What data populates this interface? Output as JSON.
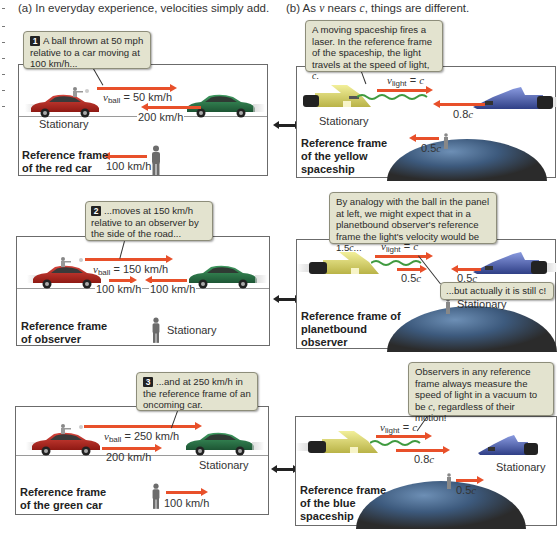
{
  "headings": {
    "a": "(a)  In everyday experience, velocities simply add.",
    "b_prefix": "(b)  As ",
    "b_v": "v",
    "b_mid": " nears ",
    "b_c": "c",
    "b_suffix": ", things are different."
  },
  "colors": {
    "arrow": "#e8502a",
    "callout_bg": "#e3e3cf",
    "red_car": "#b3231d",
    "green_car": "#2e7a4b",
    "yellow_ship": "#e2df7a",
    "blue_ship": "#4a5da8"
  },
  "left_panels": [
    {
      "callout_num": "1",
      "callout_text": "A ball thrown at 50 mph relative to a car moving at 100 km/h...",
      "v_symbol": "v",
      "v_sub": "ball",
      "v_value": " = 50 km/h",
      "green_speed": "200 km/h",
      "red_status": "Stationary",
      "observer_speed": "100 km/h",
      "frame_label_1": "Reference frame",
      "frame_label_2": "of the red car"
    },
    {
      "callout_num": "2",
      "callout_text": "...moves at 150 km/h relative to an observer by the side of the road...",
      "v_symbol": "v",
      "v_sub": "ball",
      "v_value": " = 150 km/h",
      "red_speed": "100 km/h",
      "green_speed": "100 km/h",
      "observer_status": "Stationary",
      "frame_label_1": "Reference frame",
      "frame_label_2": "of observer"
    },
    {
      "callout_num": "3",
      "callout_text": "...and at 250 km/h in the reference frame of an oncoming car.",
      "v_symbol": "v",
      "v_sub": "ball",
      "v_value": " = 250 km/h",
      "red_speed": "200 km/h",
      "green_status": "Stationary",
      "observer_speed": "100 km/h",
      "frame_label_1": "Reference frame",
      "frame_label_2": "of the green car"
    }
  ],
  "right_panels": [
    {
      "callout_text_1": "A moving spaceship fires a laser. In the reference frame of the spaceship, the light travels at the speed of light, ",
      "callout_c": "c",
      "callout_text_2": ".",
      "v_symbol": "v",
      "v_sub": "light",
      "v_eq": " = ",
      "v_c": "c",
      "blue_speed_num": "0.8",
      "blue_speed_c": "c",
      "yellow_status": "Stationary",
      "earth_speed_num": "0.5",
      "earth_speed_c": "c",
      "frame_label_1": "Reference frame",
      "frame_label_2": "of the yellow",
      "frame_label_3": "spaceship"
    },
    {
      "callout_text_1": "By analogy with the ball in the panel at left, we might expect that in a planetbound observer's reference frame the light's velocity would be 1.5",
      "callout_c": "c",
      "callout_text_2": "...",
      "v_symbol": "v",
      "v_sub": "light",
      "v_eq": " = ",
      "v_c": "c",
      "yellow_speed_num": "0.5",
      "yellow_speed_c": "c",
      "blue_speed_num": "0.5",
      "blue_speed_c": "c",
      "callout2_text": "...but actually it is still c!",
      "earth_status": "Stationary",
      "frame_label_1": "Reference frame of",
      "frame_label_2": "planetbound",
      "frame_label_3": "observer"
    },
    {
      "callout_text_1": "Observers in any reference frame always measure the speed of light in a vacuum to be ",
      "callout_c": "c",
      "callout_text_2": ", regardless of their motion!",
      "v_symbol": "v",
      "v_sub": "light",
      "v_eq": " = ",
      "v_c": "c",
      "yellow_speed_num": "0.8",
      "yellow_speed_c": "c",
      "blue_status": "Stationary",
      "earth_speed_num": "0.5",
      "earth_speed_c": "c",
      "frame_label_1": "Reference frame",
      "frame_label_2": "of the blue",
      "frame_label_3": "spaceship"
    }
  ]
}
